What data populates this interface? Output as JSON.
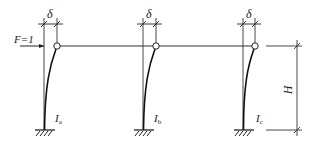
{
  "diagram": {
    "type": "structural-frame",
    "load": {
      "label": "F=1"
    },
    "columns": [
      {
        "id": "a",
        "moment_label": "I",
        "moment_sub": "a",
        "displacement_label": "δ"
      },
      {
        "id": "b",
        "moment_label": "I",
        "moment_sub": "b",
        "displacement_label": "δ"
      },
      {
        "id": "c",
        "moment_label": "I",
        "moment_sub": "c",
        "displacement_label": "δ"
      }
    ],
    "height_label": "H",
    "colors": {
      "line": "#222222",
      "background": "#ffffff"
    }
  }
}
